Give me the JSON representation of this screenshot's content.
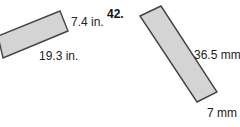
{
  "problem_number": "42.",
  "figures": [
    {
      "shape": "rectangle",
      "side_label_short": "7.4 in.",
      "side_label_long": "19.3 in.",
      "fill": "#d4d4d4",
      "stroke": "#444444"
    },
    {
      "shape": "rectangle",
      "side_label_long": "36.5 mm",
      "side_label_short": "7 mm",
      "fill": "#d4d4d4",
      "stroke": "#444444"
    }
  ]
}
